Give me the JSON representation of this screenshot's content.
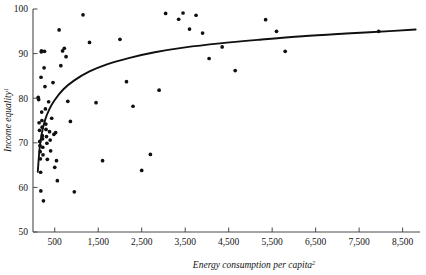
{
  "chart_data": {
    "type": "scatter",
    "title": "",
    "xlabel": "Energy consumption per capita",
    "xlabel_superscript": "2",
    "ylabel": "Income equality",
    "ylabel_superscript": "1",
    "xlim": [
      0,
      8900
    ],
    "ylim": [
      50,
      100
    ],
    "xticks": [
      500,
      1500,
      2500,
      3500,
      4500,
      5500,
      6500,
      7500,
      8500
    ],
    "xtick_labels": [
      "500",
      "1,500",
      "2,500",
      "3,500",
      "4,500",
      "5,500",
      "6,500",
      "7,500",
      "8,500"
    ],
    "yticks": [
      50,
      60,
      70,
      80,
      90,
      100
    ],
    "ytick_labels": [
      "50",
      "60",
      "70",
      "80",
      "90",
      "100"
    ],
    "grid": false,
    "legend": null,
    "marker_color": "#101010",
    "curve_color": "#101010",
    "axis_color": "#4a4a4a",
    "series": [
      {
        "name": "countries",
        "points": [
          [
            120,
            80.2
          ],
          [
            130,
            79.7
          ],
          [
            140,
            74.5
          ],
          [
            150,
            72.8
          ],
          [
            155,
            70.3
          ],
          [
            160,
            69.4
          ],
          [
            165,
            68.0
          ],
          [
            170,
            66.4
          ],
          [
            175,
            63.4
          ],
          [
            180,
            59.2
          ],
          [
            185,
            84.7
          ],
          [
            190,
            90.4
          ],
          [
            195,
            90.6
          ],
          [
            200,
            76.9
          ],
          [
            205,
            75.0
          ],
          [
            210,
            73.5
          ],
          [
            215,
            71.6
          ],
          [
            220,
            70.9
          ],
          [
            225,
            69.0
          ],
          [
            230,
            67.3
          ],
          [
            240,
            57.0
          ],
          [
            255,
            86.8
          ],
          [
            265,
            90.5
          ],
          [
            275,
            82.6
          ],
          [
            285,
            77.6
          ],
          [
            295,
            74.2
          ],
          [
            300,
            73.0
          ],
          [
            310,
            71.4
          ],
          [
            320,
            69.9
          ],
          [
            330,
            66.3
          ],
          [
            360,
            79.2
          ],
          [
            380,
            72.5
          ],
          [
            395,
            70.6
          ],
          [
            405,
            68.2
          ],
          [
            430,
            75.5
          ],
          [
            460,
            83.5
          ],
          [
            480,
            71.9
          ],
          [
            500,
            64.5
          ],
          [
            520,
            72.3
          ],
          [
            540,
            66.0
          ],
          [
            560,
            61.5
          ],
          [
            600,
            95.3
          ],
          [
            640,
            87.3
          ],
          [
            680,
            90.6
          ],
          [
            720,
            91.2
          ],
          [
            760,
            89.3
          ],
          [
            800,
            79.3
          ],
          [
            860,
            74.8
          ],
          [
            950,
            59.0
          ],
          [
            1150,
            98.7
          ],
          [
            1300,
            92.5
          ],
          [
            1450,
            79.0
          ],
          [
            1600,
            66.0
          ],
          [
            2000,
            93.2
          ],
          [
            2150,
            83.7
          ],
          [
            2300,
            78.2
          ],
          [
            2500,
            63.8
          ],
          [
            2700,
            67.4
          ],
          [
            2900,
            81.8
          ],
          [
            3050,
            99.0
          ],
          [
            3350,
            97.7
          ],
          [
            3450,
            99.1
          ],
          [
            3600,
            95.5
          ],
          [
            3750,
            98.6
          ],
          [
            3900,
            94.6
          ],
          [
            4050,
            88.9
          ],
          [
            4350,
            91.5
          ],
          [
            4650,
            86.2
          ],
          [
            5350,
            97.6
          ],
          [
            5600,
            95.0
          ],
          [
            5800,
            90.5
          ],
          [
            7950,
            95.0
          ]
        ]
      }
    ],
    "fit_curve": {
      "name": "logarithmic fit",
      "description": "Fitted log curve rising steeply at low energy use then flattening near 95",
      "points": [
        [
          110,
          63.5
        ],
        [
          150,
          68.5
        ],
        [
          200,
          72.0
        ],
        [
          280,
          75.2
        ],
        [
          380,
          77.6
        ],
        [
          500,
          79.6
        ],
        [
          700,
          82.0
        ],
        [
          950,
          84.0
        ],
        [
          1300,
          86.0
        ],
        [
          1700,
          87.6
        ],
        [
          2200,
          89.0
        ],
        [
          2800,
          90.3
        ],
        [
          3500,
          91.4
        ],
        [
          4300,
          92.3
        ],
        [
          5200,
          93.1
        ],
        [
          6200,
          93.9
        ],
        [
          7200,
          94.5
        ],
        [
          8300,
          95.1
        ],
        [
          8800,
          95.4
        ]
      ]
    }
  }
}
